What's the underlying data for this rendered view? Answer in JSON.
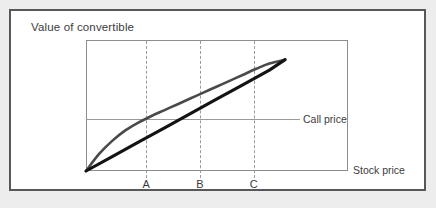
{
  "figure": {
    "title": "Value of convertible",
    "x_axis_label": "Stock price",
    "reference_line_label": "Call price",
    "frame_color": "#58585a",
    "page_background": "#ededed",
    "plot_border_color": "#8d8d90",
    "gridline_color": "#9a9a9d"
  },
  "chart_data": {
    "type": "line",
    "title": "Value of convertible",
    "xlabel": "Stock price",
    "ylabel": "Value of convertible",
    "grid": false,
    "legend": "none",
    "xlim": [
      0,
      100
    ],
    "ylim": [
      0,
      100
    ],
    "annotations": [
      {
        "name": "call-price-line",
        "label": "Call price",
        "type": "horizontal-reference-line",
        "y": 40
      },
      {
        "name": "vline-A",
        "label": "A",
        "type": "vertical-dashed-line",
        "x": 23
      },
      {
        "name": "vline-B",
        "label": "B",
        "type": "vertical-dashed-line",
        "x": 43.5
      },
      {
        "name": "vline-C",
        "label": "C",
        "type": "vertical-dashed-line",
        "x": 64
      }
    ],
    "tick_labels": {
      "x": [
        "A",
        "B",
        "C"
      ],
      "y": []
    },
    "series": [
      {
        "name": "conversion-value",
        "style": "thick-solid-black",
        "color": "#131313",
        "x": [
          0,
          10,
          20,
          30,
          40,
          50,
          60,
          70,
          76
        ],
        "y": [
          0,
          11,
          22,
          33,
          44,
          55,
          66,
          77,
          85
        ]
      },
      {
        "name": "convertible-value",
        "style": "solid-gray-curve",
        "color": "#4a4a4d",
        "x": [
          0,
          5,
          10,
          15,
          20,
          25,
          30,
          35,
          40,
          45,
          50,
          55,
          60,
          65,
          70,
          76
        ],
        "y": [
          0,
          13,
          23,
          31,
          37,
          42,
          46.5,
          51,
          55.5,
          60,
          64.5,
          69,
          73.5,
          78,
          82,
          85
        ]
      }
    ]
  }
}
